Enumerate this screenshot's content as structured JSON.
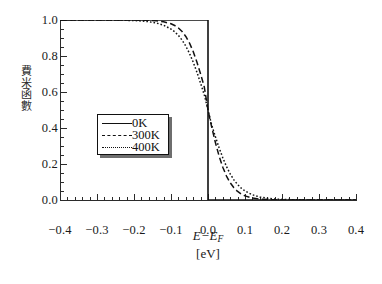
{
  "chart_data": {
    "type": "line",
    "title": "",
    "subtitle": "",
    "xlabel": "E−E_F",
    "xlabel_main_lead": "E−E",
    "xlabel_main_sub": "F",
    "xlabel_units": "[eV]",
    "ylabel": "費米函數",
    "ylabel_chars": [
      "費",
      "米",
      "函",
      "數"
    ],
    "xlim": [
      -0.4,
      0.4
    ],
    "ylim": [
      0.0,
      1.0
    ],
    "grid": false,
    "legend_position": "center-left",
    "x_major_ticks": [
      -0.4,
      -0.3,
      -0.2,
      -0.1,
      0.0,
      0.1,
      0.2,
      0.3,
      0.4
    ],
    "x_major_tick_labels": [
      "-0.4",
      "-0.3",
      "-0.2",
      "-0.1",
      "0.0",
      "0.1",
      "0.2",
      "0.3",
      "0.4"
    ],
    "x_minor_tick_step": 0.02,
    "y_major_ticks": [
      0.0,
      0.2,
      0.4,
      0.6,
      0.8,
      1.0
    ],
    "y_major_tick_labels": [
      "0.0",
      "0.2",
      "0.4",
      "0.6",
      "0.8",
      "1.0"
    ],
    "y_minor_tick_step": 0.05,
    "series": [
      {
        "name": "0K",
        "style": "solid",
        "color": "#111111",
        "description": "Step function: f=1 for E<E_F, f=0 for E>E_F",
        "x": [
          -0.4,
          -0.3,
          -0.2,
          -0.1,
          -0.05,
          -0.01,
          0.0,
          0.0,
          0.01,
          0.05,
          0.1,
          0.2,
          0.3,
          0.4
        ],
        "values": [
          1.0,
          1.0,
          1.0,
          1.0,
          1.0,
          1.0,
          1.0,
          0.0,
          0.0,
          0.0,
          0.0,
          0.0,
          0.0,
          0.0
        ]
      },
      {
        "name": "300K",
        "style": "dashed",
        "color": "#111111",
        "description": "Fermi-Dirac distribution at kT = 0.02585 eV",
        "x": [
          -0.4,
          -0.35,
          -0.3,
          -0.25,
          -0.2,
          -0.18,
          -0.16,
          -0.14,
          -0.12,
          -0.1,
          -0.09,
          -0.08,
          -0.07,
          -0.06,
          -0.05,
          -0.04,
          -0.03,
          -0.02,
          -0.01,
          0.0,
          0.01,
          0.02,
          0.03,
          0.04,
          0.05,
          0.06,
          0.07,
          0.08,
          0.09,
          0.1,
          0.12,
          0.14,
          0.16,
          0.18,
          0.2,
          0.25,
          0.3,
          0.35,
          0.4
        ],
        "values": [
          1.0,
          1.0,
          1.0,
          0.9999,
          0.9996,
          0.9991,
          0.998,
          0.9956,
          0.9903,
          0.979,
          0.9695,
          0.9556,
          0.936,
          0.9087,
          0.872,
          0.8246,
          0.7667,
          0.7,
          0.6277,
          0.5,
          0.4053,
          0.3189,
          0.2439,
          0.182,
          0.133,
          0.0955,
          0.0677,
          0.0475,
          0.0331,
          0.0229,
          0.0109,
          0.0052,
          0.0024,
          0.0012,
          0.0005,
          0.0001,
          0.0,
          0.0,
          0.0
        ]
      },
      {
        "name": "400K",
        "style": "dotted",
        "color": "#111111",
        "description": "Fermi-Dirac distribution at kT = 0.03447 eV",
        "x": [
          -0.4,
          -0.35,
          -0.3,
          -0.25,
          -0.2,
          -0.18,
          -0.16,
          -0.14,
          -0.12,
          -0.1,
          -0.09,
          -0.08,
          -0.07,
          -0.06,
          -0.05,
          -0.04,
          -0.03,
          -0.02,
          -0.01,
          0.0,
          0.01,
          0.02,
          0.03,
          0.04,
          0.05,
          0.06,
          0.07,
          0.08,
          0.09,
          0.1,
          0.12,
          0.14,
          0.16,
          0.18,
          0.2,
          0.25,
          0.3,
          0.35,
          0.4
        ],
        "values": [
          0.9999,
          0.9999,
          0.9998,
          0.9993,
          0.9971,
          0.9948,
          0.9907,
          0.9836,
          0.9712,
          0.9497,
          0.9344,
          0.9142,
          0.8881,
          0.855,
          0.8143,
          0.7658,
          0.7102,
          0.6488,
          0.5838,
          0.5,
          0.4162,
          0.3512,
          0.2898,
          0.2342,
          0.1857,
          0.145,
          0.1119,
          0.0858,
          0.0656,
          0.05,
          0.029,
          0.0167,
          0.0096,
          0.0055,
          0.0032,
          0.0008,
          0.0002,
          0.0001,
          0.0
        ]
      }
    ],
    "legend_entries": [
      "0K",
      "300K",
      "400K"
    ]
  },
  "legend": {
    "items": [
      {
        "label": "0K",
        "style": "solid"
      },
      {
        "label": "300K",
        "style": "dashed"
      },
      {
        "label": "400K",
        "style": "dotted"
      }
    ]
  },
  "axes": {
    "x_labels": [
      "-0.4",
      "-0.3",
      "-0.2",
      "-0.1",
      "0.0",
      "0.1",
      "0.2",
      "0.3",
      "0.4"
    ],
    "y_labels": [
      "0.0",
      "0.2",
      "0.4",
      "0.6",
      "0.8",
      "1.0"
    ],
    "x_title_lead": "E−E",
    "x_title_sub": "F",
    "x_units": "[eV]",
    "y_title_chars": [
      "費",
      "米",
      "函",
      "數"
    ]
  },
  "colors": {
    "axis": "#2b2b2b",
    "curve": "#111111",
    "background": "#ffffff",
    "legend_shadow": "#6e6e6e"
  }
}
